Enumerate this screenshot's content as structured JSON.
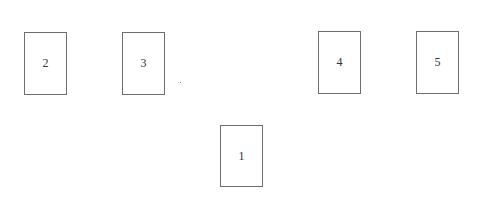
{
  "cards": [
    {
      "label": "2",
      "x": 24,
      "y": 32,
      "w": 43,
      "h": 63
    },
    {
      "label": "3",
      "x": 122,
      "y": 32,
      "w": 43,
      "h": 63
    },
    {
      "label": "4",
      "x": 318,
      "y": 31,
      "w": 43,
      "h": 63
    },
    {
      "label": "5",
      "x": 416,
      "y": 31,
      "w": 43,
      "h": 63
    },
    {
      "label": "1",
      "x": 220,
      "y": 125,
      "w": 43,
      "h": 62
    }
  ],
  "colors": {
    "border": "#6e6e6e",
    "text": "#333333",
    "background": "#ffffff"
  }
}
